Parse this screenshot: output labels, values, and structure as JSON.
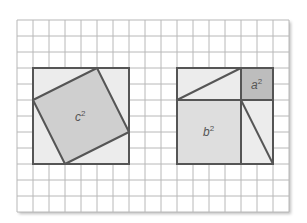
{
  "diagram": {
    "grid": {
      "x0": 17,
      "y0": 20,
      "cols": 17,
      "rows": 12,
      "cell": 16,
      "line_color": "#b8b8b8"
    },
    "colors": {
      "border": "#555555",
      "frame_fill": "#ececec",
      "c_square_fill": "#cfcfcf",
      "a_square_fill": "#bdbdbd",
      "b_square_fill": "#dedede",
      "label": "#555555"
    },
    "left_figure": {
      "frame": {
        "x": 33,
        "y": 68,
        "size": 96
      },
      "tilted_square_points": "97,68 129,132 65,164 33,100",
      "label": {
        "base": "c",
        "exp": "2",
        "x": 75,
        "y": 121
      }
    },
    "right_figure": {
      "frame": {
        "x": 177,
        "y": 68,
        "size": 96
      },
      "a_square": {
        "x": 241,
        "y": 68,
        "size": 32,
        "label": {
          "base": "a",
          "exp": "2",
          "x": 251,
          "y": 89
        }
      },
      "b_square": {
        "x": 177,
        "y": 100,
        "size": 64,
        "label": {
          "base": "b",
          "exp": "2",
          "x": 203,
          "y": 136
        }
      },
      "diagonals": [
        {
          "x1": 177,
          "y1": 100,
          "x2": 241,
          "y2": 68
        },
        {
          "x1": 241,
          "y1": 100,
          "x2": 273,
          "y2": 164
        }
      ]
    }
  }
}
